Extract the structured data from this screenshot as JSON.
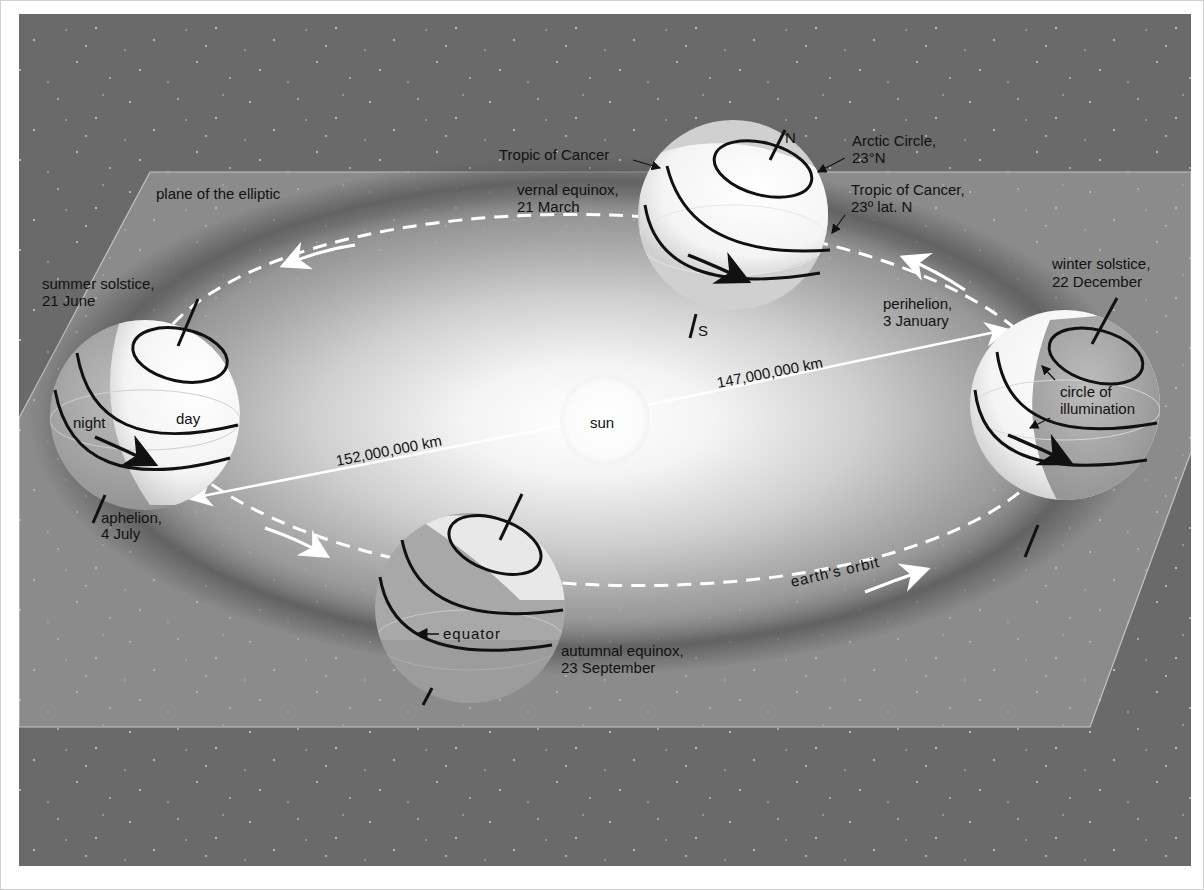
{
  "diagram": {
    "plane_label": "plane of the elliptic",
    "sun_label": "sun",
    "orbit_label": "earth's orbit",
    "distances": {
      "aphelion_distance": "152,000,000 km",
      "perihelion_distance": "147,000,000 km"
    },
    "positions": {
      "vernal": {
        "label_line1": "vernal equinox,",
        "label_line2": "21 March",
        "tropic_left": "Tropic of Cancer",
        "arctic_line1": "Arctic Circle,",
        "arctic_line2": "23°N",
        "tropic_right_line1": "Tropic of Cancer,",
        "tropic_right_line2": "23º lat. N",
        "north": "N",
        "south": "S"
      },
      "summer": {
        "label_line1": "summer solstice,",
        "label_line2": "21 June",
        "night": "night",
        "day": "day",
        "aphelion_line1": "aphelion,",
        "aphelion_line2": "4 July"
      },
      "winter": {
        "label_line1": "winter solstice,",
        "label_line2": "22  December",
        "perihelion_line1": "perihelion,",
        "perihelion_line2": "3 January",
        "illum_line1": "circle of",
        "illum_line2": "illumination"
      },
      "autumn": {
        "label_line1": "autumnal equinox,",
        "label_line2": "23 September",
        "equator": "equator"
      }
    },
    "colors": {
      "space": "#6a6a6a",
      "plane": "#8a8a8a",
      "orbit_band": "#5c5c5c",
      "glow": "#ffffff",
      "line": "#111111"
    }
  }
}
